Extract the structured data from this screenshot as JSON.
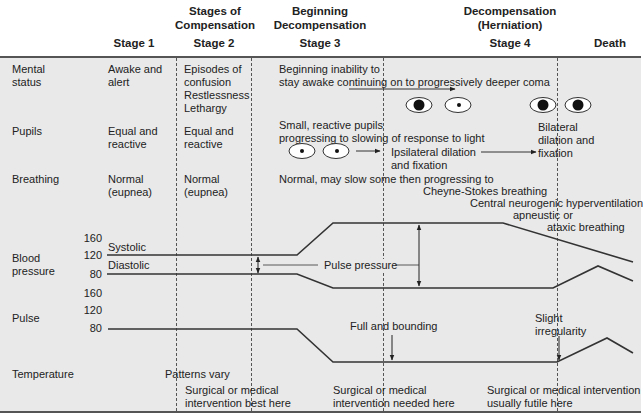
{
  "header": {
    "groups": [
      {
        "label_line1": "Stages of",
        "label_line2": "Compensation"
      },
      {
        "label_line1": "Beginning",
        "label_line2": "Decompensation"
      },
      {
        "label_line1": "Decompensation",
        "label_line2": "(Herniation)"
      }
    ],
    "stages": [
      "Stage 1",
      "Stage 2",
      "Stage 3",
      "Stage 4",
      "Death"
    ]
  },
  "rows": {
    "mental_status": {
      "label": [
        "Mental",
        "status"
      ],
      "stage1": [
        "Awake and",
        "alert"
      ],
      "stage2": [
        "Episodes of",
        "confusion",
        "Restlessness",
        "Lethargy"
      ],
      "stage3": [
        "Beginning inability to",
        "stay awake continuing on to progressively deeper coma"
      ]
    },
    "pupils": {
      "label": "Pupils",
      "stage1": [
        "Equal and",
        "reactive"
      ],
      "stage2": [
        "Equal and",
        "reactive"
      ],
      "stage3": [
        "Small, reactive pupils",
        "progressing to slowing of response to light"
      ],
      "ipsilateral": [
        "Ipsilateral dilation",
        "and fixation"
      ],
      "bilateral": [
        "Bilateral",
        "dilation and",
        "fixation"
      ],
      "icons": [
        "small-reactive-pupils",
        "ipsilateral-dilated-pupil",
        "bilateral-dilated-pupils"
      ]
    },
    "breathing": {
      "label": "Breathing",
      "stage1": [
        "Normal",
        "(eupnea)"
      ],
      "stage2": [
        "Normal",
        "(eupnea)"
      ],
      "stage3": [
        "Normal, may slow some then progressing to",
        "Cheyne-Stokes breathing"
      ],
      "stage4": [
        "Central neurogenic hyperventilation",
        "apneustic or",
        "ataxic breathing"
      ]
    },
    "blood_pressure": {
      "label": [
        "Blood",
        "pressure"
      ],
      "ticks": [
        "160",
        "120",
        "80"
      ],
      "systolic_label": "Systolic",
      "diastolic_label": "Diastolic",
      "pulse_pressure_label": "Pulse pressure"
    },
    "pulse": {
      "label": "Pulse",
      "ticks": [
        "160",
        "120",
        "80"
      ],
      "full_bounding": "Full and bounding",
      "slight_irregularity": [
        "Slight",
        "irregularity"
      ]
    },
    "temperature": {
      "label": "Temperature",
      "patterns": "Patterns vary"
    }
  },
  "interventions": {
    "best": [
      "Surgical or medical",
      "intervention best here"
    ],
    "needed": [
      "Surgical or medical",
      "intervention needed here"
    ],
    "futile": [
      "Surgical or medical intervention",
      "usually futile here"
    ]
  },
  "colors": {
    "panel_bg": "#e9e9e9",
    "line": "#333333",
    "text": "#222222"
  }
}
